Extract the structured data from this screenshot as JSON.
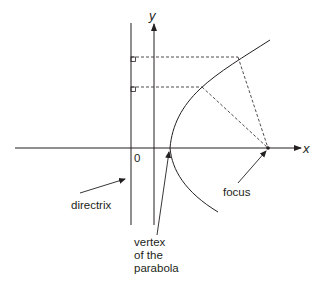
{
  "diagram": {
    "type": "parabola-focus-directrix",
    "axes": {
      "x_label": "x",
      "y_label": "y",
      "origin_label": "0"
    },
    "labels": {
      "directrix": "directrix",
      "focus": "focus",
      "vertex_line1": "vertex",
      "vertex_line2": "of the",
      "vertex_line3": "parabola"
    },
    "colors": {
      "line": "#231f20",
      "background": "#ffffff"
    }
  }
}
